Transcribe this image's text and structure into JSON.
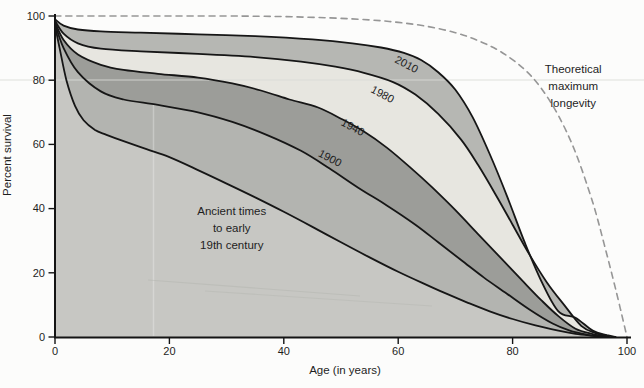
{
  "figure_title": "Percent survival by age across historical periods",
  "chart_data": {
    "type": "area",
    "title": "",
    "xlabel": "Age (in years)",
    "ylabel": "Percent survival",
    "xlim": [
      0,
      100
    ],
    "ylim": [
      0,
      100
    ],
    "xticks": [
      0,
      20,
      40,
      60,
      80,
      100
    ],
    "yticks": [
      0,
      20,
      40,
      60,
      80,
      100
    ],
    "grid": false,
    "legend": "labels-on-chart",
    "colors": {
      "band_ancient": "#c7c7c3",
      "band_1900": "#b3b4b0",
      "band_1940": "#9c9d99",
      "band_1980": "#e7e6e0",
      "band_2010": "#b6b7b3",
      "curve_stroke": "#161616",
      "dashed_stroke": "#969696",
      "axis": "#141414"
    },
    "series": [
      {
        "name": "Ancient times to early 19th century",
        "fill_mode": "baseline",
        "fill": "#c7c7c3",
        "line": "solid",
        "points": [
          [
            0,
            97
          ],
          [
            0.8,
            90
          ],
          [
            2,
            80
          ],
          [
            3.5,
            72
          ],
          [
            5,
            67.5
          ],
          [
            7,
            64.5
          ],
          [
            9,
            63
          ],
          [
            12,
            61
          ],
          [
            16,
            58.5
          ],
          [
            20,
            56
          ],
          [
            25,
            52
          ],
          [
            30,
            47.8
          ],
          [
            35,
            43.5
          ],
          [
            40,
            39
          ],
          [
            45,
            34.3
          ],
          [
            50,
            29.5
          ],
          [
            55,
            24.8
          ],
          [
            60,
            20.3
          ],
          [
            64,
            17
          ],
          [
            68,
            13.8
          ],
          [
            72,
            10.8
          ],
          [
            76,
            8
          ],
          [
            80,
            5.6
          ],
          [
            84,
            3.6
          ],
          [
            88,
            2
          ],
          [
            91,
            1
          ],
          [
            94,
            0.4
          ],
          [
            96,
            0
          ]
        ]
      },
      {
        "name": "1900",
        "fill_mode": "band",
        "fill": "#b3b4b0",
        "line": "solid",
        "points": [
          [
            0,
            97.5
          ],
          [
            1.5,
            90
          ],
          [
            4,
            82.5
          ],
          [
            8,
            76.5
          ],
          [
            12,
            74
          ],
          [
            18,
            72.3
          ],
          [
            25,
            70
          ],
          [
            31,
            67
          ],
          [
            37,
            63
          ],
          [
            43,
            58
          ],
          [
            48,
            52.5
          ],
          [
            53,
            46.5
          ],
          [
            58,
            41
          ],
          [
            63,
            35
          ],
          [
            67,
            29.5
          ],
          [
            71,
            24
          ],
          [
            75,
            18.5
          ],
          [
            79,
            13.5
          ],
          [
            83,
            8.5
          ],
          [
            87,
            4.2
          ],
          [
            90,
            2
          ],
          [
            93,
            0.7
          ],
          [
            95.5,
            0
          ]
        ]
      },
      {
        "name": "1940",
        "fill_mode": "band",
        "fill": "#9c9d99",
        "line": "solid",
        "points": [
          [
            0,
            98
          ],
          [
            1.5,
            92.5
          ],
          [
            4,
            88
          ],
          [
            8,
            84.8
          ],
          [
            12,
            83.2
          ],
          [
            18,
            82
          ],
          [
            25,
            80.8
          ],
          [
            31,
            79
          ],
          [
            36,
            76.8
          ],
          [
            41,
            74
          ],
          [
            46,
            71.5
          ],
          [
            50,
            68
          ],
          [
            54,
            64
          ],
          [
            58,
            59
          ],
          [
            62,
            53
          ],
          [
            66,
            46.5
          ],
          [
            70,
            39.5
          ],
          [
            74,
            32
          ],
          [
            78,
            24.5
          ],
          [
            82,
            17
          ],
          [
            85,
            11.5
          ],
          [
            88,
            6.5
          ],
          [
            91,
            2.6
          ],
          [
            94,
            0.9
          ],
          [
            96.5,
            0
          ]
        ]
      },
      {
        "name": "1980",
        "fill_mode": "band",
        "fill": "#e7e6e0",
        "line": "solid",
        "points": [
          [
            0,
            98.5
          ],
          [
            1.5,
            94.5
          ],
          [
            4,
            91.5
          ],
          [
            8,
            89.8
          ],
          [
            15,
            89
          ],
          [
            25,
            88.2
          ],
          [
            35,
            87.2
          ],
          [
            43,
            85.8
          ],
          [
            49,
            84.2
          ],
          [
            54,
            82.3
          ],
          [
            59,
            79.5
          ],
          [
            63,
            75.5
          ],
          [
            67,
            69.5
          ],
          [
            71,
            61.5
          ],
          [
            74,
            53.5
          ],
          [
            77,
            44.5
          ],
          [
            80,
            35
          ],
          [
            83,
            25.5
          ],
          [
            86,
            17
          ],
          [
            89,
            10
          ],
          [
            92,
            3.5
          ],
          [
            94.5,
            1.2
          ],
          [
            97,
            0
          ]
        ]
      },
      {
        "name": "2010",
        "fill_mode": "band",
        "fill": "#b6b7b3",
        "line": "solid",
        "points": [
          [
            0,
            99
          ],
          [
            1.5,
            97
          ],
          [
            4,
            95.8
          ],
          [
            8,
            95.2
          ],
          [
            15,
            94.8
          ],
          [
            25,
            94.3
          ],
          [
            35,
            93.7
          ],
          [
            45,
            92.7
          ],
          [
            52,
            91.5
          ],
          [
            57,
            90.2
          ],
          [
            61,
            88.5
          ],
          [
            64,
            86.3
          ],
          [
            67,
            82.5
          ],
          [
            70,
            77
          ],
          [
            73,
            68.5
          ],
          [
            76,
            57
          ],
          [
            79,
            44
          ],
          [
            82,
            30
          ],
          [
            85,
            17.5
          ],
          [
            88,
            8
          ],
          [
            91,
            6
          ],
          [
            94,
            2
          ],
          [
            96.5,
            0.6
          ],
          [
            98,
            0
          ]
        ]
      },
      {
        "name": "Theoretical maximum longevity",
        "fill_mode": "none",
        "fill": null,
        "line": "dashed",
        "points": [
          [
            0,
            100
          ],
          [
            15,
            100
          ],
          [
            30,
            100
          ],
          [
            40,
            99.8
          ],
          [
            48,
            99.4
          ],
          [
            55,
            98.8
          ],
          [
            60,
            98
          ],
          [
            65,
            96.8
          ],
          [
            70,
            94.8
          ],
          [
            74,
            92.3
          ],
          [
            78,
            88.8
          ],
          [
            82,
            83.5
          ],
          [
            85,
            77.5
          ],
          [
            88,
            69
          ],
          [
            91,
            57.5
          ],
          [
            94,
            42
          ],
          [
            96,
            29
          ],
          [
            98,
            15
          ],
          [
            100,
            0
          ]
        ]
      }
    ],
    "annotations": [
      {
        "text": "2010",
        "x": 61.5,
        "y": 85,
        "rotate": 28,
        "size": 11
      },
      {
        "text": "1980",
        "x": 57.3,
        "y": 75.7,
        "rotate": 28,
        "size": 11
      },
      {
        "text": "1940",
        "x": 52.1,
        "y": 65.4,
        "rotate": 28,
        "size": 11
      },
      {
        "text": "1900",
        "x": 48.1,
        "y": 55.8,
        "rotate": 28,
        "size": 11
      },
      {
        "text": "Ancient times\nto early\n19th century",
        "x": 30.9,
        "y": 34,
        "rotate": 0,
        "size": 11.5
      },
      {
        "text": "Theoretical\nmaximum\nlongevity",
        "x": 90.6,
        "y": 78.2,
        "rotate": 0,
        "size": 11.5
      }
    ]
  }
}
